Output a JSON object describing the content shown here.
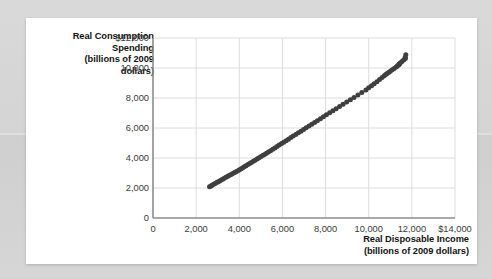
{
  "chart_data": {
    "type": "scatter",
    "title": "",
    "xlabel": "Real Disposable Income (billions of 2009 dollars)",
    "ylabel": "Real Consumption Spending (billions of 2009 dollars)",
    "xlabel_lines": [
      "Real Disposable Income",
      "(billions of 2009 dollars)"
    ],
    "ylabel_lines": [
      "Real Consumption",
      "Spending",
      "(billions of 2009",
      "dollars)"
    ],
    "xlim": [
      0,
      14000
    ],
    "ylim": [
      0,
      12000
    ],
    "xticks": [
      0,
      2000,
      4000,
      6000,
      8000,
      10000,
      12000,
      14000
    ],
    "yticks": [
      0,
      2000,
      4000,
      6000,
      8000,
      10000,
      12000
    ],
    "xtick_labels": [
      "0",
      "2,000",
      "4,000",
      "6,000",
      "8,000",
      "10,000",
      "12,000",
      "$14,000"
    ],
    "ytick_labels": [
      "0",
      "2,000",
      "4,000",
      "6,000",
      "8,000",
      "10,000",
      "$12,000"
    ],
    "grid": true,
    "grid_color": "#dcdcdc",
    "axis_color": "#8c8c8c",
    "marker_color": "#3f3f3f",
    "marker_size": 5,
    "legend": null,
    "points": [
      [
        2620,
        2090
      ],
      [
        2680,
        2140
      ],
      [
        2740,
        2190
      ],
      [
        2810,
        2250
      ],
      [
        2880,
        2300
      ],
      [
        2950,
        2360
      ],
      [
        3020,
        2420
      ],
      [
        3090,
        2470
      ],
      [
        3160,
        2530
      ],
      [
        3230,
        2590
      ],
      [
        3300,
        2650
      ],
      [
        3380,
        2710
      ],
      [
        3450,
        2770
      ],
      [
        3520,
        2830
      ],
      [
        3600,
        2890
      ],
      [
        3680,
        2950
      ],
      [
        3760,
        3010
      ],
      [
        3830,
        3070
      ],
      [
        3910,
        3130
      ],
      [
        3990,
        3200
      ],
      [
        4070,
        3270
      ],
      [
        4150,
        3340
      ],
      [
        4230,
        3410
      ],
      [
        4310,
        3480
      ],
      [
        4400,
        3560
      ],
      [
        4480,
        3630
      ],
      [
        4560,
        3700
      ],
      [
        4650,
        3780
      ],
      [
        4730,
        3850
      ],
      [
        4820,
        3930
      ],
      [
        4900,
        4000
      ],
      [
        4990,
        4080
      ],
      [
        5080,
        4160
      ],
      [
        5170,
        4240
      ],
      [
        5260,
        4320
      ],
      [
        5350,
        4400
      ],
      [
        5450,
        4490
      ],
      [
        5550,
        4580
      ],
      [
        5650,
        4670
      ],
      [
        5750,
        4760
      ],
      [
        5850,
        4860
      ],
      [
        5960,
        4960
      ],
      [
        6060,
        5050
      ],
      [
        6170,
        5150
      ],
      [
        6280,
        5250
      ],
      [
        6390,
        5360
      ],
      [
        6500,
        5460
      ],
      [
        6620,
        5570
      ],
      [
        6740,
        5680
      ],
      [
        6860,
        5790
      ],
      [
        6980,
        5900
      ],
      [
        7100,
        6010
      ],
      [
        7230,
        6130
      ],
      [
        7360,
        6250
      ],
      [
        7490,
        6370
      ],
      [
        7620,
        6490
      ],
      [
        7760,
        6620
      ],
      [
        7900,
        6750
      ],
      [
        8040,
        6880
      ],
      [
        8190,
        7010
      ],
      [
        8340,
        7150
      ],
      [
        8490,
        7290
      ],
      [
        8650,
        7430
      ],
      [
        8810,
        7580
      ],
      [
        8980,
        7730
      ],
      [
        9150,
        7880
      ],
      [
        9320,
        8040
      ],
      [
        9500,
        8200
      ],
      [
        9680,
        8360
      ],
      [
        9870,
        8530
      ],
      [
        10000,
        8680
      ],
      [
        10130,
        8820
      ],
      [
        10250,
        8950
      ],
      [
        10380,
        9090
      ],
      [
        10500,
        9230
      ],
      [
        10620,
        9360
      ],
      [
        10720,
        9480
      ],
      [
        10790,
        9560
      ],
      [
        10850,
        9630
      ],
      [
        10920,
        9700
      ],
      [
        11000,
        9790
      ],
      [
        11090,
        9880
      ],
      [
        11180,
        9970
      ],
      [
        11270,
        10060
      ],
      [
        11330,
        10130
      ],
      [
        11390,
        10210
      ],
      [
        11420,
        10260
      ],
      [
        11400,
        10240
      ],
      [
        11460,
        10330
      ],
      [
        11540,
        10430
      ],
      [
        11620,
        10530
      ],
      [
        11700,
        10640
      ],
      [
        11690,
        10720
      ],
      [
        11720,
        10880
      ]
    ]
  }
}
